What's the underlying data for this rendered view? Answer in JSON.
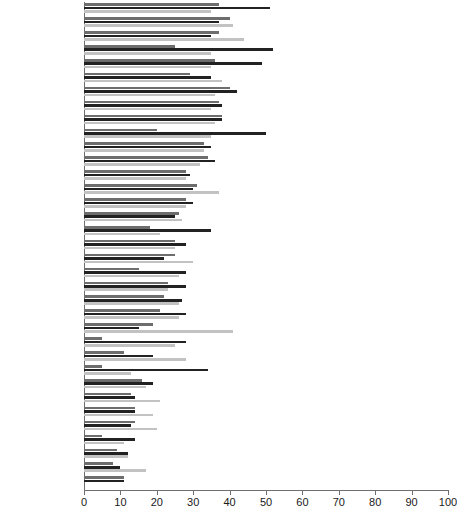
{
  "chart_data": {
    "type": "bar",
    "orientation": "horizontal",
    "title": "",
    "xlabel": "",
    "ylabel": "",
    "xlim": [
      0,
      100
    ],
    "xticks": [
      0,
      10,
      20,
      30,
      40,
      50,
      60,
      70,
      80,
      90,
      100
    ],
    "grid": false,
    "legend": "none",
    "series": [
      {
        "name": "series-1",
        "color": "#6d6d6d",
        "values": [
          37,
          40,
          37,
          25,
          36,
          29,
          40,
          37,
          38,
          20,
          33,
          34,
          28,
          31,
          28,
          26,
          18,
          25,
          25,
          15,
          23,
          22,
          21,
          19,
          5,
          11,
          5,
          16,
          13,
          14,
          14,
          5,
          9,
          8,
          11
        ]
      },
      {
        "name": "series-2",
        "color": "#222222",
        "values": [
          51,
          37,
          35,
          52,
          49,
          35,
          42,
          38,
          38,
          50,
          35,
          36,
          29,
          30,
          30,
          25,
          35,
          28,
          22,
          28,
          28,
          27,
          28,
          15,
          28,
          19,
          34,
          19,
          14,
          14,
          13,
          14,
          12,
          10,
          11
        ]
      },
      {
        "name": "series-3",
        "color": "#c2c2c2",
        "values": [
          35,
          41,
          44,
          35,
          35,
          38,
          36,
          35,
          36,
          35,
          33,
          32,
          28,
          37,
          28,
          27,
          21,
          25,
          30,
          26,
          23,
          26,
          26,
          41,
          25,
          28,
          13,
          17,
          21,
          19,
          20,
          11,
          12,
          17,
          0
        ]
      }
    ],
    "categories": [
      "Sweden",
      "Norway",
      "Iceland",
      "France",
      "Slovenia",
      "Finland",
      "Denmark",
      "Netherlands",
      "Spain",
      "Canada",
      "Germany",
      "New Zealand",
      "Italy",
      "Belgium",
      "United Kingdom",
      "Australia",
      "Switzerland",
      "Ireland",
      "Austria",
      "Portugal",
      "Poland",
      "Latvia",
      "Israel",
      "Mexico",
      "Estonia",
      "Luxembourg",
      "Chile",
      "United States",
      "Greece",
      "Slovak Republic",
      "Czech Republic",
      "Turkey",
      "Japan",
      "Korea",
      "Hungary"
    ]
  }
}
